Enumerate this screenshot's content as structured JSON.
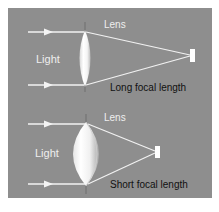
{
  "colors": {
    "background": "#ffffff",
    "panel": "#8e8e8e",
    "ray": "#f2f2f2",
    "label_light": "#eeeeee",
    "caption": "#111111",
    "focal_point": "#ffffff"
  },
  "top_diagram": {
    "light_label": "Light",
    "lens_label": "Lens",
    "caption": "Long focal length",
    "lens_type": "thin convex lens",
    "focal_point": "sensor-marker"
  },
  "bottom_diagram": {
    "light_label": "Light",
    "lens_label": "Lens",
    "caption": "Short focal length",
    "lens_type": "thick convex lens",
    "focal_point": "sensor-marker"
  }
}
